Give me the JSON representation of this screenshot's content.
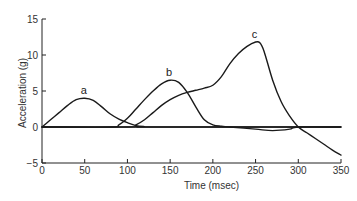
{
  "chart_data": {
    "type": "line",
    "title": "",
    "xlabel": "Time (msec)",
    "ylabel": "Acceleration (g)",
    "xlim": [
      0,
      350
    ],
    "ylim": [
      -5,
      15
    ],
    "xticks": [
      0,
      50,
      100,
      150,
      200,
      250,
      300,
      350
    ],
    "yticks": [
      -5,
      0,
      5,
      10,
      15
    ],
    "xtick_labels": [
      "0",
      "50",
      "100",
      "150",
      "200",
      "250",
      "300",
      "350"
    ],
    "ytick_labels": [
      "−5",
      "0",
      "5",
      "10",
      "15"
    ],
    "grid": false,
    "legend": "none",
    "zero_line": true,
    "series": [
      {
        "name": "a",
        "label_at": [
          50,
          4
        ],
        "x": [
          0,
          10,
          20,
          30,
          40,
          50,
          60,
          70,
          80,
          90,
          100,
          110,
          120,
          130,
          350
        ],
        "y": [
          0,
          1.0,
          2.0,
          3.0,
          3.8,
          4.0,
          3.7,
          2.8,
          1.8,
          1.1,
          0.6,
          0.2,
          0.05,
          0,
          0
        ]
      },
      {
        "name": "b",
        "label_at": [
          150,
          6.5
        ],
        "x": [
          0,
          80,
          90,
          100,
          110,
          120,
          130,
          140,
          150,
          160,
          170,
          180,
          190,
          200,
          210,
          220,
          250,
          270,
          290,
          300,
          350
        ],
        "y": [
          0,
          0,
          0.3,
          1.2,
          2.5,
          3.8,
          5.0,
          6.0,
          6.5,
          6.2,
          4.8,
          2.8,
          1.0,
          0.3,
          0.1,
          0,
          -0.3,
          -0.5,
          -0.3,
          0,
          0
        ]
      },
      {
        "name": "c",
        "label_at": [
          250,
          11.8
        ],
        "x": [
          0,
          100,
          110,
          120,
          130,
          140,
          150,
          160,
          170,
          180,
          190,
          200,
          210,
          220,
          230,
          240,
          250,
          255,
          260,
          270,
          280,
          290,
          300,
          310,
          320,
          330,
          340,
          350
        ],
        "y": [
          0,
          0,
          0.3,
          1.0,
          2.0,
          3.0,
          3.8,
          4.4,
          4.8,
          5.1,
          5.4,
          5.8,
          7.0,
          8.8,
          10.2,
          11.2,
          11.8,
          11.7,
          10.5,
          6.5,
          3.5,
          1.5,
          0,
          -0.8,
          -1.6,
          -2.4,
          -3.2,
          -3.9
        ]
      }
    ]
  }
}
